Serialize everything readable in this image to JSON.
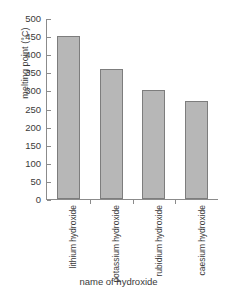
{
  "chart_data": {
    "type": "bar",
    "title": "",
    "xlabel": "name of hydroxide",
    "ylabel": "melting point (°C)",
    "categories": [
      "lithium hydroxide",
      "potassium hydroxide",
      "rubidium hydroxide",
      "caesium hydroxide"
    ],
    "category_lines": [
      [
        "lithium",
        "hydroxide"
      ],
      [
        "potassium",
        "hydroxide"
      ],
      [
        "rubidium",
        "hydroxide"
      ],
      [
        "caesium",
        "hydroxide"
      ]
    ],
    "values": [
      450,
      360,
      300,
      270
    ],
    "ylim": [
      0,
      500
    ],
    "ytick_values": [
      500,
      450,
      400,
      350,
      300,
      250,
      200,
      150,
      100,
      50,
      0
    ],
    "ytick_labels": [
      "500",
      "450",
      "400",
      "350",
      "300",
      "250",
      "200",
      "150",
      "100",
      "50",
      "0"
    ],
    "grid": false,
    "legend": "none",
    "bar_color": "#b7b7b7",
    "bar_border_color": "#7d7d7d",
    "axis_color": "#8b8b8b",
    "text_color": "#3a3a3a"
  }
}
